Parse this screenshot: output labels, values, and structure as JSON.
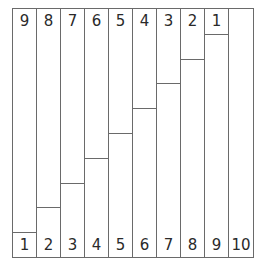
{
  "diagram": {
    "columns": [
      {
        "top_label": "9",
        "bottom_label": "1",
        "divider_units_from_top": 9
      },
      {
        "top_label": "8",
        "bottom_label": "2",
        "divider_units_from_top": 8
      },
      {
        "top_label": "7",
        "bottom_label": "3",
        "divider_units_from_top": 7
      },
      {
        "top_label": "6",
        "bottom_label": "4",
        "divider_units_from_top": 6
      },
      {
        "top_label": "5",
        "bottom_label": "5",
        "divider_units_from_top": 5
      },
      {
        "top_label": "4",
        "bottom_label": "6",
        "divider_units_from_top": 4
      },
      {
        "top_label": "3",
        "bottom_label": "7",
        "divider_units_from_top": 3
      },
      {
        "top_label": "2",
        "bottom_label": "8",
        "divider_units_from_top": 2
      },
      {
        "top_label": "1",
        "bottom_label": "9",
        "divider_units_from_top": 1
      },
      {
        "top_label": "",
        "bottom_label": "10",
        "divider_units_from_top": 0
      }
    ],
    "total_units": 10,
    "line_color": "#6a6a6a",
    "text_color": "#2a2a2a",
    "background": "#ffffff"
  }
}
